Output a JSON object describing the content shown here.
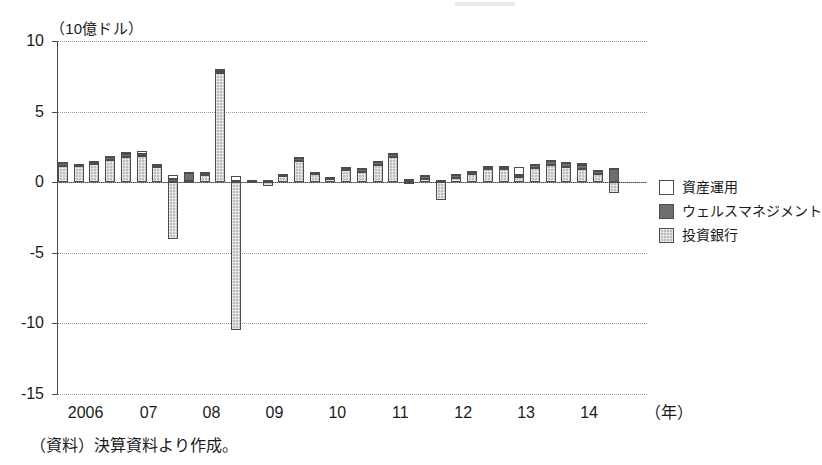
{
  "axis": {
    "unit_label": "（10億ドル）",
    "x_unit_label": "（年）",
    "y_ticks": [
      "10",
      "5",
      "0",
      "-5",
      "-10",
      "-15"
    ],
    "x_ticks": [
      "2006",
      "07",
      "08",
      "09",
      "10",
      "11",
      "12",
      "13",
      "14"
    ]
  },
  "legend": {
    "items": [
      {
        "label": "資産運用",
        "key": "asset",
        "color": "#ffffff"
      },
      {
        "label": "ウェルスマネジメント",
        "key": "wealth",
        "color": "#6f6f6f"
      },
      {
        "label": "投資銀行",
        "key": "ibank",
        "color": "#bdbdbd"
      }
    ]
  },
  "source_note": "（資料）決算資料より作成。",
  "chart_data": {
    "type": "bar",
    "title": "",
    "subtitle": "",
    "xlabel": "（年）",
    "ylabel": "（10億ドル）",
    "ylim": [
      -15,
      10
    ],
    "y_ticks": [
      10,
      5,
      0,
      -5,
      -10,
      -15
    ],
    "grid": true,
    "stacked": true,
    "legend_position": "right",
    "x_tick_labels": [
      "2006",
      "07",
      "08",
      "09",
      "10",
      "11",
      "12",
      "13",
      "14"
    ],
    "categories": [
      "2006Q1",
      "2006Q2",
      "2006Q3",
      "2006Q4",
      "2007Q1",
      "2007Q2",
      "2007Q3",
      "2007Q4",
      "2008Q1",
      "2008Q2",
      "2008Q3",
      "2008Q4",
      "2009Q1",
      "2009Q2",
      "2009Q3",
      "2009Q4",
      "2010Q1",
      "2010Q2",
      "2010Q3",
      "2010Q4",
      "2011Q1",
      "2011Q2",
      "2011Q3",
      "2011Q4",
      "2012Q1",
      "2012Q2",
      "2012Q3",
      "2012Q4",
      "2013Q1",
      "2013Q2",
      "2013Q3",
      "2013Q4",
      "2014Q1",
      "2014Q2",
      "2014Q3",
      "2014Q4"
    ],
    "series": [
      {
        "name": "投資銀行",
        "key": "ibank",
        "values": [
          1.15,
          1.15,
          1.3,
          1.55,
          1.75,
          1.85,
          1.1,
          -4.0,
          0.1,
          0.5,
          7.7,
          -10.5,
          0.05,
          -0.25,
          0.45,
          1.5,
          0.6,
          0.2,
          0.85,
          0.75,
          1.25,
          1.8,
          -0.15,
          0.25,
          -1.25,
          0.3,
          0.55,
          0.9,
          0.9,
          0.35,
          1.0,
          1.25,
          1.05,
          0.95,
          0.55,
          -0.8
        ]
      },
      {
        "name": "ウェルスマネジメント",
        "key": "wealth",
        "values": [
          0.2,
          0.1,
          0.18,
          0.22,
          0.25,
          0.15,
          0.15,
          0.22,
          0.55,
          0.15,
          0.2,
          0.05,
          0.08,
          0.1,
          0.1,
          0.22,
          0.1,
          0.1,
          0.15,
          0.15,
          0.18,
          0.18,
          0.15,
          0.18,
          0.12,
          0.18,
          0.18,
          0.15,
          0.18,
          0.18,
          0.22,
          0.22,
          0.28,
          0.3,
          0.22,
          0.95
        ]
      },
      {
        "name": "資産運用",
        "key": "asset",
        "values": [
          0.05,
          0.05,
          0.05,
          0.08,
          0.15,
          0.2,
          0.05,
          0.3,
          0.08,
          0.05,
          0.1,
          0.4,
          0.05,
          0.05,
          0.05,
          0.1,
          0.05,
          0.05,
          0.08,
          0.08,
          0.08,
          0.1,
          0.05,
          0.05,
          0.05,
          0.08,
          0.08,
          0.08,
          0.1,
          0.55,
          0.1,
          0.1,
          0.12,
          0.12,
          0.1,
          0.08
        ]
      }
    ]
  }
}
